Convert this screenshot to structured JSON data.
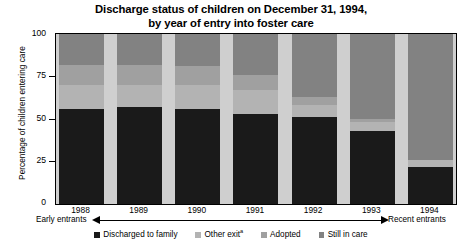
{
  "title": {
    "line1": "Discharge status of children on December 31, 1994,",
    "line2": "by year of entry into foster care"
  },
  "axes": {
    "ylabel": "Percentage of children entering care",
    "yticks": [
      "0",
      "25",
      "50",
      "75",
      "100"
    ],
    "xticks": [
      "1988",
      "1989",
      "1990",
      "1991",
      "1992",
      "1993",
      "1994"
    ]
  },
  "annotations": {
    "left_entrants": "Early entrants",
    "right_entrants": "Recent entrants"
  },
  "legend": {
    "items": [
      {
        "label": "Discharged to family",
        "sup": "",
        "color": "#1a1a1a"
      },
      {
        "label": "Other exit",
        "sup": "a",
        "color": "#b3b3b3"
      },
      {
        "label": "Adopted",
        "sup": "",
        "color": "#a0a0a0"
      },
      {
        "label": "Still in care",
        "sup": "",
        "color": "#828282"
      }
    ]
  },
  "colors": {
    "discharged": "#1a1a1a",
    "other_exit": "#b3b3b3",
    "adopted": "#a0a0a0",
    "still_in_care": "#828282",
    "plot_background": "#cfcfcf",
    "axis": "#000000"
  },
  "chart_data": {
    "type": "bar",
    "stacked": true,
    "title": "Discharge status of children on December 31, 1994, by year of entry into foster care",
    "xlabel": "",
    "ylabel": "Percentage of children entering care",
    "ylim": [
      0,
      100
    ],
    "yticks": [
      0,
      25,
      50,
      75,
      100
    ],
    "grid": false,
    "legend_position": "bottom",
    "categories": [
      "1988",
      "1989",
      "1990",
      "1991",
      "1992",
      "1993",
      "1994"
    ],
    "series": [
      {
        "name": "Discharged to family",
        "color": "#1a1a1a",
        "values": [
          56,
          57,
          56,
          53,
          51,
          43,
          22
        ]
      },
      {
        "name": "Other exit",
        "color": "#b3b3b3",
        "values": [
          14,
          13,
          14,
          14,
          7,
          5,
          4
        ]
      },
      {
        "name": "Adopted",
        "color": "#a0a0a0",
        "values": [
          12,
          12,
          11,
          9,
          5,
          2,
          0
        ]
      },
      {
        "name": "Still in care",
        "color": "#828282",
        "values": [
          18,
          18,
          19,
          24,
          37,
          50,
          74
        ]
      }
    ]
  }
}
